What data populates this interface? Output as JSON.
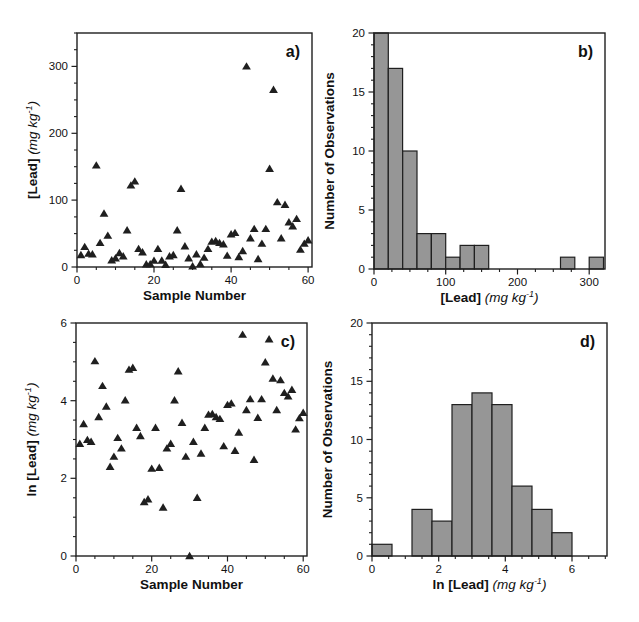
{
  "colors": {
    "background": "#ffffff",
    "marker": "#1f1f1f",
    "bar_fill": "#969696",
    "bar_edge": "#1f1f1f",
    "axis": "#1f1f1f",
    "text": "#111111"
  },
  "chart_data": [
    {
      "panel": "a)",
      "type": "scatter",
      "marker": "filled-triangle",
      "title": "Lead concentration by sample number",
      "xlabel_parts": [
        {
          "t": "Sample Number",
          "s": "bold"
        }
      ],
      "ylabel_parts": [
        {
          "t": "[Lead] ",
          "s": "bold"
        },
        {
          "t": "(mg kg",
          "s": "italic"
        },
        {
          "t": "-1",
          "s": "sup"
        },
        {
          "t": ")",
          "s": "italic"
        }
      ],
      "xlim": [
        0,
        61
      ],
      "ylim": [
        0,
        350
      ],
      "xticks": [
        0,
        20,
        40,
        60
      ],
      "yticks": [
        0,
        100,
        200,
        300
      ],
      "x_minor_step": 5,
      "y_minor_step": 25,
      "x": [
        1,
        2,
        3,
        4,
        5,
        6,
        7,
        8,
        9,
        10,
        11,
        12,
        13,
        14,
        15,
        16,
        17,
        18,
        19,
        20,
        21,
        22,
        23,
        24,
        25,
        26,
        27,
        28,
        29,
        30,
        31,
        32,
        33,
        34,
        35,
        36,
        37,
        38,
        39,
        40,
        41,
        42,
        43,
        44,
        45,
        46,
        47,
        48,
        49,
        50,
        51,
        52,
        53,
        54,
        55,
        56,
        57,
        58,
        59,
        60
      ],
      "y": [
        18,
        30,
        20,
        19,
        152,
        36,
        80,
        47,
        10,
        13,
        21,
        16,
        55,
        122,
        128,
        27,
        22,
        4,
        4.3,
        9.5,
        27,
        9.7,
        3.5,
        16,
        18,
        55,
        117,
        31,
        13,
        1,
        19,
        4.5,
        14,
        27,
        38,
        39,
        36,
        34,
        17,
        49,
        51,
        15,
        24,
        300,
        43,
        57,
        12,
        35,
        57,
        147,
        265,
        97,
        43,
        93,
        67,
        61,
        72,
        26,
        35,
        40
      ]
    },
    {
      "panel": "b)",
      "type": "histogram",
      "title": "Histogram of lead concentrations",
      "xlabel_parts": [
        {
          "t": "[Lead] ",
          "s": "bold"
        },
        {
          "t": "(mg kg",
          "s": "italic"
        },
        {
          "t": "-1",
          "s": "sup"
        },
        {
          "t": ")",
          "s": "italic"
        }
      ],
      "ylabel_parts": [
        {
          "t": "Number of Observations",
          "s": "bold"
        }
      ],
      "xlim": [
        0,
        322
      ],
      "ylim": [
        0,
        20
      ],
      "xticks": [
        0,
        100,
        200,
        300
      ],
      "yticks": [
        0,
        5,
        10,
        15,
        20
      ],
      "x_minor_step": 25,
      "y_minor_step": 1,
      "bin_width": 20,
      "bin_starts": [
        0,
        20,
        40,
        60,
        80,
        100,
        120,
        140,
        160,
        180,
        200,
        220,
        240,
        260,
        280,
        300
      ],
      "counts": [
        20,
        17,
        10,
        3,
        3,
        1,
        2,
        2,
        0,
        0,
        0,
        0,
        0,
        1,
        0,
        1
      ]
    },
    {
      "panel": "c)",
      "type": "scatter",
      "marker": "filled-triangle",
      "title": "Natural log of lead concentration by sample number",
      "xlabel_parts": [
        {
          "t": "Sample Number",
          "s": "bold"
        }
      ],
      "ylabel_parts": [
        {
          "t": "ln [Lead] ",
          "s": "bold"
        },
        {
          "t": "(mg kg",
          "s": "italic"
        },
        {
          "t": "-1",
          "s": "sup"
        },
        {
          "t": ")",
          "s": "italic"
        }
      ],
      "xlim": [
        0,
        61
      ],
      "ylim": [
        0,
        6
      ],
      "xticks": [
        0,
        20,
        40,
        60
      ],
      "yticks": [
        0,
        2,
        4,
        6
      ],
      "x_minor_step": 5,
      "y_minor_step": 0.5,
      "x": [
        1,
        2,
        3,
        4,
        5,
        6,
        7,
        8,
        9,
        10,
        11,
        12,
        13,
        14,
        15,
        16,
        17,
        18,
        19,
        20,
        21,
        22,
        23,
        24,
        25,
        26,
        27,
        28,
        29,
        30,
        31,
        32,
        33,
        34,
        35,
        36,
        37,
        38,
        39,
        40,
        41,
        42,
        43,
        44,
        45,
        46,
        47,
        48,
        49,
        50,
        51,
        52,
        53,
        54,
        55,
        56,
        57,
        58,
        59,
        60
      ],
      "y": [
        2.89,
        3.4,
        2.99,
        2.94,
        5.02,
        3.58,
        4.38,
        3.85,
        2.3,
        2.56,
        3.04,
        2.77,
        4.01,
        4.8,
        4.85,
        3.3,
        3.09,
        1.39,
        1.46,
        2.25,
        3.3,
        2.27,
        1.25,
        2.77,
        2.89,
        4.01,
        4.76,
        3.43,
        2.56,
        0,
        2.94,
        1.5,
        2.64,
        3.3,
        3.64,
        3.66,
        3.58,
        3.53,
        2.83,
        3.89,
        3.93,
        2.71,
        3.18,
        5.7,
        3.76,
        4.04,
        2.48,
        3.56,
        4.04,
        4.99,
        5.58,
        4.57,
        3.76,
        4.53,
        4.2,
        4.11,
        4.28,
        3.26,
        3.55,
        3.69
      ]
    },
    {
      "panel": "d)",
      "type": "histogram",
      "title": "Histogram of ln lead concentrations",
      "xlabel_parts": [
        {
          "t": "ln [Lead] ",
          "s": "bold"
        },
        {
          "t": "(mg kg",
          "s": "italic"
        },
        {
          "t": "-1",
          "s": "sup"
        },
        {
          "t": ")",
          "s": "italic"
        }
      ],
      "ylabel_parts": [
        {
          "t": "Number of Observations",
          "s": "bold"
        }
      ],
      "xlim": [
        0,
        7.05
      ],
      "ylim": [
        0,
        20
      ],
      "xticks": [
        0,
        2,
        4,
        6
      ],
      "yticks": [
        0,
        5,
        10,
        15,
        20
      ],
      "x_minor_step": 0.5,
      "y_minor_step": 1,
      "bin_width": 0.6,
      "bin_starts": [
        0,
        0.6,
        1.2,
        1.8,
        2.4,
        3.0,
        3.6,
        4.2,
        4.8,
        5.4
      ],
      "counts": [
        1,
        0,
        4,
        3,
        13,
        14,
        13,
        6,
        4,
        2
      ]
    }
  ]
}
